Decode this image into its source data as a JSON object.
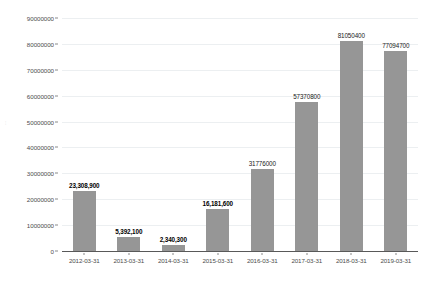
{
  "chart_data": {
    "type": "bar",
    "title": "",
    "subtitle": "",
    "xlabel": "",
    "ylabel": "",
    "categories": [
      "2012-03-31",
      "2013-03-31",
      "2014-03-31",
      "2015-03-31",
      "2016-03-31",
      "2017-03-31",
      "2018-03-31",
      "2019-03-31"
    ],
    "values": [
      23308900,
      5392100,
      2340300,
      16181600,
      31776000,
      57370800,
      81050400,
      77094700
    ],
    "data_labels": [
      "23,308,900",
      "5,392,100",
      "2,340,300",
      "16,181,600",
      "31776000",
      "57370800",
      "81050400",
      "77094700"
    ],
    "data_label_bold": [
      true,
      true,
      true,
      true,
      false,
      false,
      false,
      false
    ],
    "ylim": [
      0,
      90000000
    ],
    "ytick_values": [
      0,
      10000000,
      20000000,
      30000000,
      40000000,
      50000000,
      60000000,
      70000000,
      80000000,
      90000000
    ],
    "ytick_labels": [
      "0",
      "10000000",
      "20000000",
      "30000000",
      "40000000",
      "50000000",
      "60000000",
      "70000000",
      "80000000",
      "90000000"
    ],
    "grid": true,
    "legend": false,
    "bar_color": "#969696",
    "gridline_color": "#eceff1",
    "axis_color": "#595959",
    "background_color": "#ffffff"
  },
  "artifacts": {
    "left_margin_mark": "⫶"
  }
}
